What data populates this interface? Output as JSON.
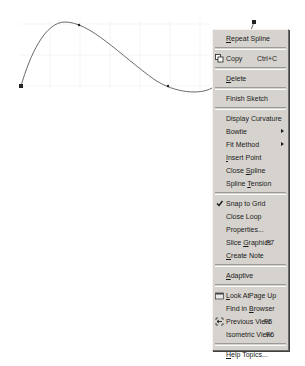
{
  "sketch": {
    "curve_color": "#6a6a6a",
    "grid_color": "#eeeeee",
    "endpoint_start": {
      "x": 21,
      "y": 86
    },
    "endpoint_end": {
      "x": 254,
      "y": 22
    }
  },
  "context_menu": {
    "background": "#d6d3ce",
    "items": [
      {
        "label": "Repeat Spline",
        "underline": "R",
        "group": 1
      },
      {
        "label": "Copy",
        "shortcut": "Ctrl+C",
        "icon": "copy-icon",
        "group": 2
      },
      {
        "label": "Delete",
        "underline": "D",
        "group": 3
      },
      {
        "label": "Finish Sketch",
        "group": 4
      },
      {
        "label": "Display Curvature",
        "group": 5
      },
      {
        "label": "Bowtie",
        "submenu": true,
        "group": 5
      },
      {
        "label": "Fit Method",
        "submenu": true,
        "group": 5
      },
      {
        "label": "Insert Point",
        "underline": "I",
        "group": 5
      },
      {
        "label": "Close Spline",
        "underline": "S",
        "group": 5
      },
      {
        "label": "Spline Tension",
        "underline": "T",
        "group": 5
      },
      {
        "label": "Snap to Grid",
        "checked": true,
        "group": 6
      },
      {
        "label": "Close Loop",
        "group": 6
      },
      {
        "label": "Properties...",
        "group": 6
      },
      {
        "label": "Slice Graphics",
        "shortcut": "F7",
        "underline": "G",
        "group": 6
      },
      {
        "label": "Create Note",
        "underline": "C",
        "group": 6
      },
      {
        "label": "Adaptive",
        "underline": "A",
        "group": 7
      },
      {
        "label": "Look At",
        "shortcut": "Page Up",
        "icon": "look-at-icon",
        "underline": "L",
        "group": 8
      },
      {
        "label": "Find in Browser",
        "underline": "B",
        "group": 8
      },
      {
        "label": "Previous View",
        "shortcut": "F5",
        "icon": "previous-view-icon",
        "group": 8
      },
      {
        "label": "Isometric View",
        "shortcut": "F6",
        "group": 8
      },
      {
        "label": "Help Topics...",
        "underline": "H",
        "group": 9
      }
    ]
  }
}
